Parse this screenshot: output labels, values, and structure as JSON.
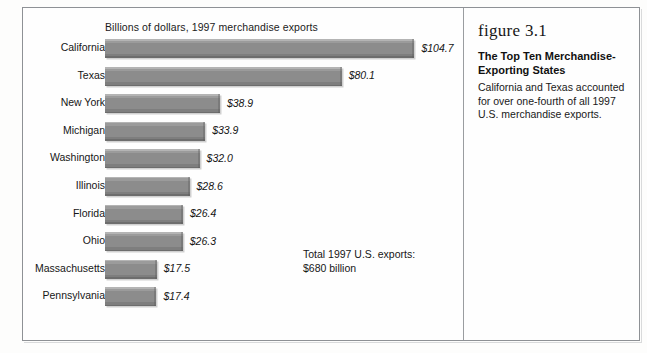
{
  "figure": {
    "number_label": "figure 3.1",
    "title": "The Top Ten Merchandise-Exporting States",
    "body": "California and Texas accounted for over one-fourth of all 1997 U.S. merchandise exports."
  },
  "notes": {
    "total_line1": "Total 1997 U.S. exports:",
    "total_line2": "$680 billion"
  },
  "chart_data": {
    "type": "bar",
    "orientation": "horizontal",
    "title": "",
    "subtitle": "Billions of dollars, 1997 merchandise exports",
    "xlabel": "Billions of dollars, 1997 merchandise exports",
    "ylabel": "",
    "xlim": [
      0,
      110
    ],
    "grid": false,
    "legend": null,
    "bar_color": "#8d8d8d",
    "categories": [
      "California",
      "Texas",
      "New York",
      "Michigan",
      "Washington",
      "Illinois",
      "Florida",
      "Ohio",
      "Massachusetts",
      "Pennsylvania"
    ],
    "values": [
      104.7,
      80.1,
      38.9,
      33.9,
      32.0,
      28.6,
      26.4,
      26.3,
      17.5,
      17.4
    ],
    "data_labels": [
      "$104.7",
      "$80.1",
      "$38.9",
      "$33.9",
      "$32.0",
      "$28.6",
      "$26.4",
      "$26.3",
      "$17.5",
      "$17.4"
    ],
    "annotations": [
      "Total 1997 U.S. exports:",
      "$680 billion"
    ]
  }
}
